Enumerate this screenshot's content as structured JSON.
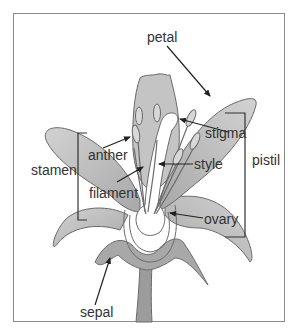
{
  "diagram": {
    "labels": {
      "petal": "petal",
      "stigma": "stigma",
      "anther": "anther",
      "style": "style",
      "pistil": "pistil",
      "stamen": "stamen",
      "filament": "filament",
      "ovary": "ovary",
      "sepal": "sepal"
    },
    "colors": {
      "petal_fill": "#c8c8c8",
      "petal_dark": "#a9a9a9",
      "outline": "#6a6a6a",
      "stem": "#9a9a9a",
      "ovary_inner": "#ffffff",
      "arrow": "#222222",
      "label_text": "#333333",
      "frame": "#8a8a8a"
    }
  }
}
